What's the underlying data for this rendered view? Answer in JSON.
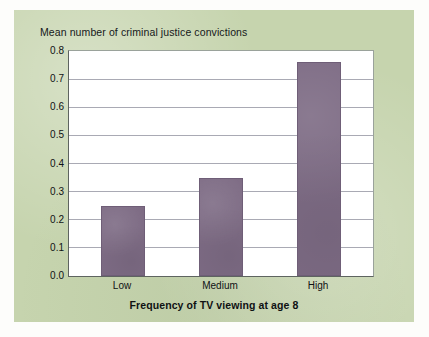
{
  "chart_data": {
    "type": "bar",
    "title": "Mean number of criminal justice convictions",
    "xlabel": "Frequency of TV viewing at age 8",
    "ylabel": "",
    "categories": [
      "Low",
      "Medium",
      "High"
    ],
    "values": [
      0.25,
      0.35,
      0.76
    ],
    "ylim": [
      0.0,
      0.8
    ],
    "ytick_labels": [
      "0.8",
      "0.7",
      "0.6",
      "0.5",
      "0.4",
      "0.3",
      "0.2",
      "0.1",
      "0.0"
    ],
    "ytick_values": [
      0.8,
      0.7,
      0.6,
      0.5,
      0.4,
      0.3,
      0.2,
      0.1,
      0.0
    ],
    "grid": true,
    "legend": false,
    "bar_color": "#7d6b84",
    "plot_background": "#ffffff",
    "panel_background": "#c6d4ae",
    "gridline_color": "#a9aab4"
  },
  "labels": {
    "title": "Mean number of criminal justice convictions",
    "xlabel": "Frequency of TV viewing at age 8",
    "cat_0": "Low",
    "cat_1": "Medium",
    "cat_2": "High",
    "y_0": "0.8",
    "y_1": "0.7",
    "y_2": "0.6",
    "y_3": "0.5",
    "y_4": "0.4",
    "y_5": "0.3",
    "y_6": "0.2",
    "y_7": "0.1",
    "y_8": "0.0"
  }
}
